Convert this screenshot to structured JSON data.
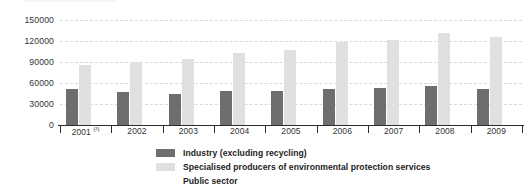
{
  "chart_data": {
    "type": "bar",
    "title": "",
    "xlabel": "",
    "ylabel": "",
    "categories": [
      "2001 (²)",
      "2002",
      "2003",
      "2004",
      "2005",
      "2006",
      "2007",
      "2008",
      "2009"
    ],
    "ylim": [
      0,
      150000
    ],
    "yticks": [
      0,
      30000,
      60000,
      90000,
      120000,
      150000
    ],
    "ytick_labels": [
      "0",
      "30000",
      "60000",
      "90000",
      "120000",
      "150000"
    ],
    "grid": true,
    "legend_position": "bottom",
    "series": [
      {
        "name": "Industry (excluding recycling)",
        "color": "#6e6e6e",
        "values": [
          51000,
          47000,
          44000,
          48000,
          48500,
          51000,
          53000,
          56000,
          51500
        ]
      },
      {
        "name": "Specialised producers of environmental protection services",
        "color": "#e0e0e0",
        "values": [
          86000,
          90000,
          95000,
          103000,
          107000,
          119000,
          122000,
          131000,
          126000
        ]
      },
      {
        "name": "Public sector",
        "color": "#ffffff",
        "values": [
          0,
          0,
          0,
          0,
          0,
          0,
          0,
          0,
          0
        ]
      }
    ]
  },
  "axis": {
    "y_tick_0": "0",
    "y_tick_1": "30000",
    "y_tick_2": "60000",
    "y_tick_3": "90000",
    "y_tick_4": "120000",
    "y_tick_5": "150000"
  },
  "legend": {
    "items": [
      {
        "label": "Industry (excluding recycling)",
        "color": "#6e6e6e"
      },
      {
        "label": "Specialised producers of environmental protection services",
        "color": "#e0e0e0"
      },
      {
        "label": "Public sector",
        "color": "#ffffff"
      }
    ]
  },
  "colors": {
    "grid": "#d9d9d9",
    "axis": "#2b2b2b",
    "text": "#333333",
    "background": "#ffffff"
  }
}
